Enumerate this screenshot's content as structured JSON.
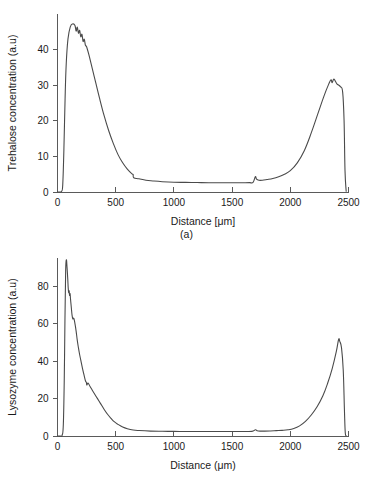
{
  "figure": {
    "background_color": "#ffffff",
    "line_color": "#4a4a4a",
    "axis_color": "#5a5a5a"
  },
  "panels": [
    {
      "caption": "(a)",
      "ylabel": "Trehalose concentration (a.u)",
      "xlabel": "Distance [μm]"
    },
    {
      "caption": "(b)",
      "ylabel": "Lysozyme concentration (a.u)",
      "xlabel": "Distance (μm)"
    }
  ],
  "chart_data": [
    {
      "type": "line",
      "title": "",
      "subtitle": "(a)",
      "xlabel": "Distance [μm]",
      "ylabel": "Trehalose concentration (a.u)",
      "xlim": [
        0,
        2500
      ],
      "ylim": [
        0,
        50
      ],
      "xticks": [
        0,
        500,
        1000,
        1500,
        2000,
        2500
      ],
      "yticks": [
        0,
        10,
        20,
        30,
        40
      ],
      "grid": false,
      "legend": "none",
      "series": [
        {
          "name": "Trehalose concentration",
          "x": [
            0,
            20,
            35,
            45,
            55,
            65,
            75,
            90,
            110,
            130,
            150,
            160,
            170,
            180,
            190,
            200,
            210,
            220,
            230,
            240,
            250,
            270,
            300,
            330,
            360,
            400,
            440,
            480,
            520,
            560,
            600,
            640,
            650,
            655,
            700,
            760,
            820,
            900,
            1000,
            1100,
            1200,
            1300,
            1400,
            1500,
            1600,
            1650,
            1680,
            1700,
            1710,
            1730,
            1760,
            1800,
            1850,
            1900,
            1950,
            2000,
            2060,
            2120,
            2180,
            2240,
            2290,
            2330,
            2350,
            2360,
            2375,
            2400,
            2430,
            2450,
            2462,
            2470,
            2480
          ],
          "y": [
            0,
            0,
            0.2,
            2,
            12,
            26,
            36,
            43,
            46.4,
            47.2,
            46.8,
            45.2,
            46.3,
            44.6,
            45.4,
            43.6,
            44.3,
            42.3,
            42.9,
            41.2,
            40.8,
            38.5,
            34.5,
            30.5,
            26.5,
            21.5,
            17.2,
            13.6,
            10.5,
            8.2,
            6.4,
            5.1,
            4.9,
            4.0,
            3.7,
            3.3,
            3.1,
            2.9,
            2.75,
            2.7,
            2.65,
            2.6,
            2.6,
            2.6,
            2.6,
            2.62,
            2.7,
            4.3,
            3.6,
            3.3,
            3.3,
            3.5,
            3.8,
            4.3,
            5.0,
            6.0,
            8.2,
            11.6,
            16.6,
            22.3,
            27.0,
            30.3,
            31.5,
            30.7,
            31.7,
            30.4,
            29.6,
            28.0,
            20.0,
            6.0,
            0.2
          ]
        }
      ]
    },
    {
      "type": "line",
      "title": "",
      "subtitle": "(b)",
      "xlabel": "Distance (μm)",
      "ylabel": "Lysozyme concentration (a.u)",
      "xlim": [
        0,
        2500
      ],
      "ylim": [
        0,
        95
      ],
      "xticks": [
        0,
        500,
        1000,
        1500,
        2000,
        2500
      ],
      "yticks": [
        0,
        20,
        40,
        60,
        80
      ],
      "grid": false,
      "legend": "none",
      "series": [
        {
          "name": "Lysozyme concentration",
          "x": [
            0,
            25,
            40,
            50,
            58,
            64,
            70,
            76,
            82,
            88,
            92,
            96,
            100,
            104,
            108,
            112,
            118,
            125,
            132,
            140,
            150,
            160,
            170,
            180,
            190,
            200,
            215,
            230,
            240,
            248,
            252,
            262,
            280,
            300,
            320,
            345,
            370,
            400,
            430,
            460,
            490,
            520,
            560,
            600,
            650,
            700,
            800,
            900,
            1000,
            1100,
            1200,
            1300,
            1400,
            1500,
            1600,
            1670,
            1700,
            1715,
            1740,
            1780,
            1830,
            1880,
            1930,
            1980,
            2030,
            2080,
            2130,
            2180,
            2230,
            2280,
            2320,
            2360,
            2395,
            2415,
            2425,
            2440,
            2455,
            2465,
            2472,
            2480
          ],
          "y": [
            0,
            0,
            0.5,
            6,
            30,
            62,
            88,
            94,
            90,
            84,
            79,
            76.5,
            77.5,
            75,
            76,
            73,
            69,
            64.5,
            62.5,
            62.8,
            60,
            56,
            51,
            47,
            43.5,
            40.5,
            36,
            32,
            29.5,
            28.6,
            27.2,
            28.3,
            26.4,
            24.3,
            22.3,
            19.8,
            17.3,
            14.3,
            11.6,
            9.4,
            7.5,
            6.2,
            4.8,
            3.9,
            3.2,
            2.9,
            2.6,
            2.5,
            2.45,
            2.4,
            2.4,
            2.4,
            2.4,
            2.4,
            2.4,
            2.45,
            3.3,
            2.8,
            2.6,
            2.6,
            2.7,
            2.85,
            3.0,
            3.3,
            4.0,
            5.4,
            7.8,
            11.2,
            15.6,
            21.5,
            28.0,
            36.0,
            45.0,
            51.5,
            50.5,
            47.0,
            35.0,
            14.0,
            2.0,
            0.2
          ]
        }
      ]
    }
  ]
}
